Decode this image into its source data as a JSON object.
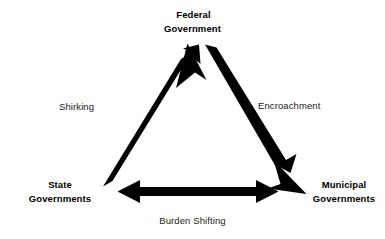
{
  "diagram": {
    "type": "triangle-relationship-diagram",
    "background_color": "#ffffff",
    "stroke_color": "#000000",
    "nodes": [
      {
        "id": "federal",
        "line1": "Federal",
        "line2": "Government",
        "position": "top"
      },
      {
        "id": "state",
        "line1": "State",
        "line2": "Governments",
        "position": "bottom-left"
      },
      {
        "id": "municipal",
        "line1": "Municipal",
        "line2": "Governments",
        "position": "bottom-right"
      }
    ],
    "edges": [
      {
        "id": "shirking",
        "label": "Shirking",
        "from": "state",
        "to": "federal",
        "direction": "single",
        "side": "left"
      },
      {
        "id": "encroachment",
        "label": "Encroachment",
        "from": "federal",
        "to": "municipal",
        "direction": "single",
        "side": "right"
      },
      {
        "id": "burden-shifting",
        "label": "Burden Shifting",
        "from": "state",
        "to": "municipal",
        "direction": "double",
        "side": "bottom"
      }
    ]
  }
}
